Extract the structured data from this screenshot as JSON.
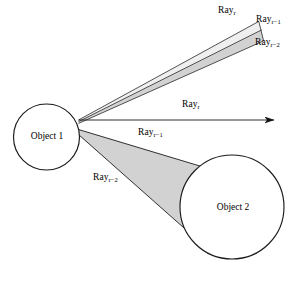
{
  "figure": {
    "type": "ray-tracing-diagram",
    "width": 303,
    "height": 281,
    "background_color": "#ffffff",
    "stroke_color": "#1a1a1a",
    "beam_fill_color": "#d2d2d2",
    "beam_fill_color_light": "#e8e8e8"
  },
  "objects": [
    {
      "id": "object-1",
      "label": "Object 1",
      "shape": "circle",
      "cx": 46.5,
      "cy": 137,
      "r": 33
    },
    {
      "id": "object-2",
      "label": "Object 2",
      "shape": "circle",
      "cx": 232,
      "cy": 207,
      "r": 52
    }
  ],
  "labels": {
    "ray_r_top": {
      "base": "Ray",
      "sub": "r"
    },
    "ray_r_minus_1_top": {
      "base": "Ray",
      "sub": "r−1"
    },
    "ray_r_minus_2_top": {
      "base": "Ray",
      "sub": "r−2"
    },
    "ray_r_middle": {
      "base": "Ray",
      "sub": "r"
    },
    "ray_r_minus_1_middle": {
      "base": "Ray",
      "sub": "r−1"
    },
    "ray_r_minus_2_lower": {
      "base": "Ray",
      "sub": "r−2"
    },
    "object_1": "Object 1",
    "object_2": "Object 2"
  },
  "rays": [
    {
      "id": "ray-r-upper",
      "label": "Ray r",
      "description": "upper thin boundary ray of the reflected beam toward upper right",
      "from": [
        78,
        120
      ],
      "to": [
        258,
        22
      ]
    },
    {
      "id": "ray-r-minus-1-upper",
      "label": "Ray r-1",
      "description": "middle boundary of the upper narrow beam",
      "from": [
        78,
        121
      ],
      "to": [
        261,
        30
      ]
    },
    {
      "id": "ray-r-minus-2-upper",
      "label": "Ray r-2",
      "description": "lower boundary of the upper narrow beam",
      "from": [
        78,
        123
      ],
      "to": [
        263,
        41
      ]
    },
    {
      "id": "ray-r-horizontal",
      "label": "Ray r",
      "description": "horizontal arrow ray leaving Object 1 to the right",
      "from": [
        78,
        120
      ],
      "to": [
        282,
        120
      ],
      "arrowhead": true
    },
    {
      "id": "ray-r-minus-1-lower",
      "label": "Ray r-1",
      "description": "upper boundary of the wide lower beam reaching Object 2",
      "from": [
        78,
        130
      ],
      "to": [
        201,
        166
      ]
    },
    {
      "id": "ray-r-minus-2-lower",
      "label": "Ray r-2",
      "description": "lower boundary of the wide lower beam reaching Object 2",
      "from": [
        78,
        134
      ],
      "to": [
        186,
        230
      ]
    }
  ],
  "beams": [
    {
      "id": "upper-beam",
      "description": "narrow shaded beam from Object 1 toward upper right",
      "fill": "#d2d2d2"
    },
    {
      "id": "lower-beam",
      "description": "wide shaded beam from Object 1 onto Object 2",
      "fill": "#d2d2d2"
    }
  ]
}
